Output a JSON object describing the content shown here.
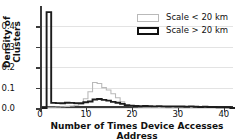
{
  "chart_data": {
    "type": "line",
    "title": "",
    "xlabel": "Number of Times Device Accesses Address",
    "ylabel": "Density of Clusters",
    "xlim": [
      0,
      42
    ],
    "ylim": [
      0.0,
      0.5
    ],
    "xticks": [
      "0",
      "10",
      "20",
      "30",
      "40"
    ],
    "xtick_values": [
      0,
      10,
      20,
      30,
      40
    ],
    "yticks": [
      "0.0",
      "0.1",
      "0.2",
      "0.3",
      "0.4"
    ],
    "ytick_values": [
      0.0,
      0.1,
      0.2,
      0.3,
      0.4
    ],
    "grid": true,
    "legend_position": "upper right",
    "x": [
      0,
      1,
      2,
      3,
      4,
      5,
      6,
      7,
      8,
      9,
      10,
      11,
      12,
      13,
      14,
      15,
      16,
      17,
      18,
      19,
      20,
      21,
      22,
      23,
      24,
      25,
      26,
      27,
      28,
      29,
      30,
      31,
      32,
      33,
      34,
      35,
      36,
      37,
      38,
      39,
      40,
      41
    ],
    "series": [
      {
        "name": "Scale < 20 km",
        "color": "#b9b9b9",
        "linewidth": 1.1,
        "values": [
          0.0,
          0.004,
          0.004,
          0.005,
          0.006,
          0.008,
          0.01,
          0.014,
          0.02,
          0.045,
          0.08,
          0.125,
          0.12,
          0.1,
          0.088,
          0.07,
          0.05,
          0.03,
          0.012,
          0.008,
          0.006,
          0.005,
          0.004,
          0.004,
          0.003,
          0.003,
          0.003,
          0.002,
          0.002,
          0.002,
          0.002,
          0.002,
          0.002,
          0.001,
          0.001,
          0.001,
          0.001,
          0.001,
          0.001,
          0.001,
          0.001,
          0.0
        ]
      },
      {
        "name": "Scale > 20 km",
        "color": "#1c1c1c",
        "linewidth": 1.9,
        "values": [
          0.0,
          0.47,
          0.025,
          0.024,
          0.023,
          0.026,
          0.025,
          0.024,
          0.023,
          0.028,
          0.032,
          0.042,
          0.044,
          0.04,
          0.036,
          0.03,
          0.026,
          0.02,
          0.014,
          0.011,
          0.01,
          0.009,
          0.01,
          0.009,
          0.008,
          0.009,
          0.008,
          0.007,
          0.008,
          0.007,
          0.007,
          0.006,
          0.008,
          0.006,
          0.005,
          0.006,
          0.005,
          0.005,
          0.004,
          0.004,
          0.004,
          0.0
        ]
      }
    ]
  },
  "legend": {
    "items": [
      {
        "label": "Scale < 20 km",
        "style": "light"
      },
      {
        "label": "Scale > 20 km",
        "style": "dark"
      }
    ]
  },
  "axes": {
    "x_title": "Number of Times Device Accesses Address",
    "y_title": "Density of Clusters"
  }
}
